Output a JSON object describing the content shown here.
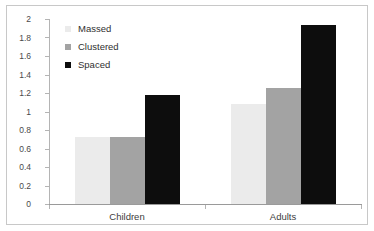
{
  "chart_data": {
    "type": "bar",
    "title": "",
    "subtitle": "",
    "xlabel": "",
    "ylabel": "",
    "categories": [
      "Children",
      "Adults"
    ],
    "series": [
      {
        "name": "Massed",
        "color": "#ebebeb",
        "values": [
          0.72,
          1.08
        ]
      },
      {
        "name": "Clustered",
        "color": "#a3a3a3",
        "values": [
          0.72,
          1.25
        ]
      },
      {
        "name": "Spaced",
        "color": "#0d0d0d",
        "values": [
          1.18,
          1.93
        ]
      }
    ],
    "ylim": [
      0,
      2
    ],
    "ytick_labels": [
      "2",
      "1.8",
      "1.6",
      "1.4",
      "1.2",
      "1",
      "0.8",
      "0.6",
      "0.4",
      "0.2",
      "0"
    ],
    "ytick_values": [
      2,
      1.8,
      1.6,
      1.4,
      1.2,
      1,
      0.8,
      0.6,
      0.4,
      0.2,
      0
    ],
    "grid": false,
    "legend_position": "top-left",
    "legend_entries": [
      "Massed",
      "Clustered",
      "Spaced"
    ],
    "annotations": [],
    "frame_border_color": "#c8c8c8",
    "axis_color": "#b4b4b4",
    "background_color": "#ffffff"
  }
}
